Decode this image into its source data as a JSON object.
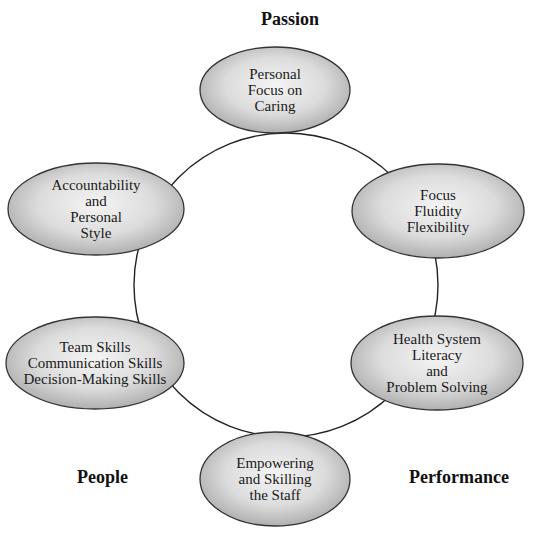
{
  "diagram": {
    "title_labels": {
      "top": "Passion",
      "bottom_left": "People",
      "bottom_right": "Performance"
    },
    "circle": {
      "cx": 286,
      "cy": 285,
      "r": 152,
      "stroke": "#222222"
    },
    "colors": {
      "ellipse_center": "#f2f2f2",
      "ellipse_edge": "#a8a8a8",
      "ellipse_stroke": "#333333",
      "background": "#ffffff"
    },
    "nodes": [
      {
        "id": "top",
        "cx": 275,
        "cy": 90,
        "rx": 75,
        "ry": 43,
        "lines": [
          "Personal",
          "Focus on",
          "Caring"
        ]
      },
      {
        "id": "upper-left",
        "cx": 96,
        "cy": 209,
        "rx": 88,
        "ry": 46,
        "lines": [
          "Accountability",
          "and",
          "Personal",
          "Style"
        ]
      },
      {
        "id": "upper-right",
        "cx": 438,
        "cy": 211,
        "rx": 86,
        "ry": 47,
        "lines": [
          "Focus",
          "Fluidity",
          "Flexibility"
        ]
      },
      {
        "id": "lower-left",
        "cx": 95,
        "cy": 363,
        "rx": 89,
        "ry": 46,
        "lines": [
          "Team Skills",
          "Communication Skills",
          "Decision-Making Skills"
        ]
      },
      {
        "id": "lower-right",
        "cx": 437,
        "cy": 363,
        "rx": 86,
        "ry": 47,
        "lines": [
          "Health System",
          "Literacy",
          "and",
          "Problem Solving"
        ]
      },
      {
        "id": "bottom",
        "cx": 275,
        "cy": 479,
        "rx": 75,
        "ry": 47,
        "lines": [
          "Empowering",
          "and Skilling",
          "the Staff"
        ]
      }
    ]
  }
}
